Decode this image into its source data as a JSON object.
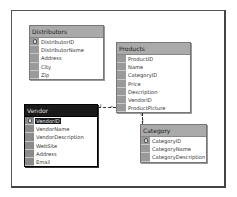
{
  "diagram": {
    "tables": [
      {
        "name": "Distributors",
        "selected": false,
        "fields": [
          {
            "name": "DistributorID",
            "primary_key": true
          },
          {
            "name": "DistributorName",
            "primary_key": false
          },
          {
            "name": "Address",
            "primary_key": false
          },
          {
            "name": "City",
            "primary_key": false
          },
          {
            "name": "Zip",
            "primary_key": false
          }
        ]
      },
      {
        "name": "Products",
        "selected": false,
        "fields": [
          {
            "name": "ProductID",
            "primary_key": false
          },
          {
            "name": "Name",
            "primary_key": false
          },
          {
            "name": "CategoryID",
            "primary_key": false
          },
          {
            "name": "Price",
            "primary_key": false
          },
          {
            "name": "Description",
            "primary_key": false
          },
          {
            "name": "VendorID",
            "primary_key": false
          },
          {
            "name": "ProductPicture",
            "primary_key": false
          }
        ]
      },
      {
        "name": "Vendor",
        "selected": true,
        "fields": [
          {
            "name": "VendorID",
            "primary_key": true,
            "highlighted": true
          },
          {
            "name": "VendorName",
            "primary_key": false
          },
          {
            "name": "VendorDescription",
            "primary_key": false
          },
          {
            "name": "WebSite",
            "primary_key": false
          },
          {
            "name": "Address",
            "primary_key": false
          },
          {
            "name": "Email",
            "primary_key": false
          }
        ]
      },
      {
        "name": "Category",
        "selected": false,
        "fields": [
          {
            "name": "CategoryID",
            "primary_key": true
          },
          {
            "name": "CategoryName",
            "primary_key": false
          },
          {
            "name": "CategoryDescription",
            "primary_key": false
          }
        ]
      }
    ],
    "relationships": [
      {
        "from": "Vendor",
        "to": "Products",
        "from_end": "key-icon",
        "to_end": "infinity-icon"
      },
      {
        "from": "Category",
        "to": "Products",
        "from_end": "key-icon",
        "to_end": "infinity-icon"
      }
    ],
    "colors": {
      "title_bar": "#aaaaaa",
      "selected_title_bar": "#1a1a1a",
      "row_selector": "#9a9a9a",
      "background": "#ffffff"
    },
    "end_glyphs": {
      "key": "⚷",
      "infinity": "∞"
    }
  }
}
